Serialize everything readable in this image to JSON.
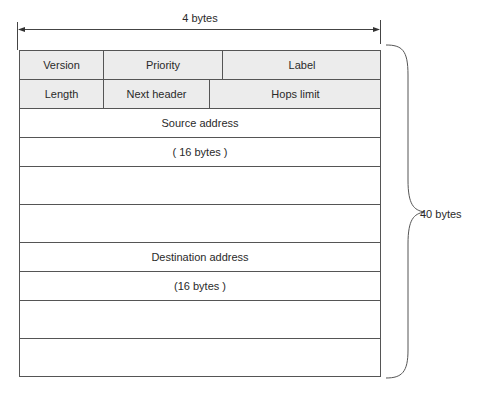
{
  "diagram": {
    "width_label": "4  bytes",
    "total_label": "40 bytes",
    "rows": [
      {
        "cells": [
          {
            "label": "Version"
          },
          {
            "label": "Priority"
          },
          {
            "label": "Label"
          }
        ]
      },
      {
        "cells": [
          {
            "label": "Length"
          },
          {
            "label": "Next header"
          },
          {
            "label": "Hops limit"
          }
        ]
      },
      {
        "cells": [
          {
            "label": "Source address"
          }
        ]
      },
      {
        "cells": [
          {
            "label": "( 16    bytes   )"
          }
        ]
      },
      {
        "cells": [
          {
            "label": ""
          }
        ]
      },
      {
        "cells": [
          {
            "label": ""
          }
        ]
      },
      {
        "cells": [
          {
            "label": "Destination address"
          }
        ]
      },
      {
        "cells": [
          {
            "label": "(16    bytes   )"
          }
        ]
      },
      {
        "cells": [
          {
            "label": ""
          }
        ]
      },
      {
        "cells": [
          {
            "label": ""
          }
        ]
      }
    ]
  },
  "colors": {
    "header_row_fill": "#ececec",
    "line": "#555555",
    "background": "#ffffff"
  }
}
